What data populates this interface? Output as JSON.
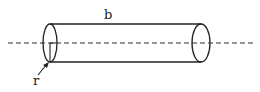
{
  "diagram": {
    "labels": {
      "length": "b",
      "radius": "r"
    },
    "colors": {
      "stroke": "#222222",
      "background": "#ffffff"
    }
  }
}
